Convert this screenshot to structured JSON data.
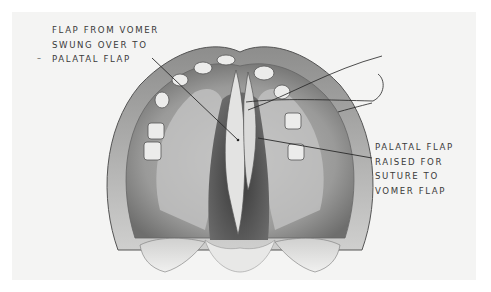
{
  "figure": {
    "colors": {
      "background": "#ffffff",
      "paper": "#f4f4f3",
      "tissue_light": "#dcdcdb",
      "tissue_mid": "#a9a9a8",
      "tissue_dark": "#4a4a4a",
      "label_text": "#3a3a3a",
      "leader_line": "#2a2a2a"
    },
    "labels": {
      "left": {
        "lines": [
          "FLAP FROM VOMER",
          "SWUNG OVER TO",
          "PALATAL FLAP"
        ],
        "mark": "–"
      },
      "right": {
        "lines": [
          "PALATAL FLAP",
          "RAISED FOR",
          "SUTURE TO",
          "VOMER FLAP"
        ]
      }
    }
  }
}
